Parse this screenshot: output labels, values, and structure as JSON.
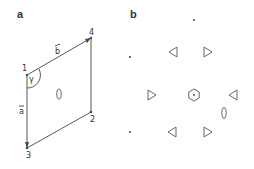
{
  "panels": [
    {
      "label": "a",
      "vertices": [
        {
          "id": "1",
          "label": "1"
        },
        {
          "id": "2",
          "label": "2"
        },
        {
          "id": "3",
          "label": "3"
        },
        {
          "id": "4",
          "label": "4"
        }
      ],
      "vectors": [
        {
          "name": "b",
          "label": "b"
        },
        {
          "name": "a",
          "label": "a"
        }
      ],
      "angle_label": "γ",
      "center_symbol": "2-fold-axis-ellipse"
    },
    {
      "label": "b",
      "symbols": [
        "6-fold-axis-hexagon",
        "triangle-left",
        "triangle-right",
        "2-fold-axis-ellipse",
        "dot"
      ]
    }
  ]
}
